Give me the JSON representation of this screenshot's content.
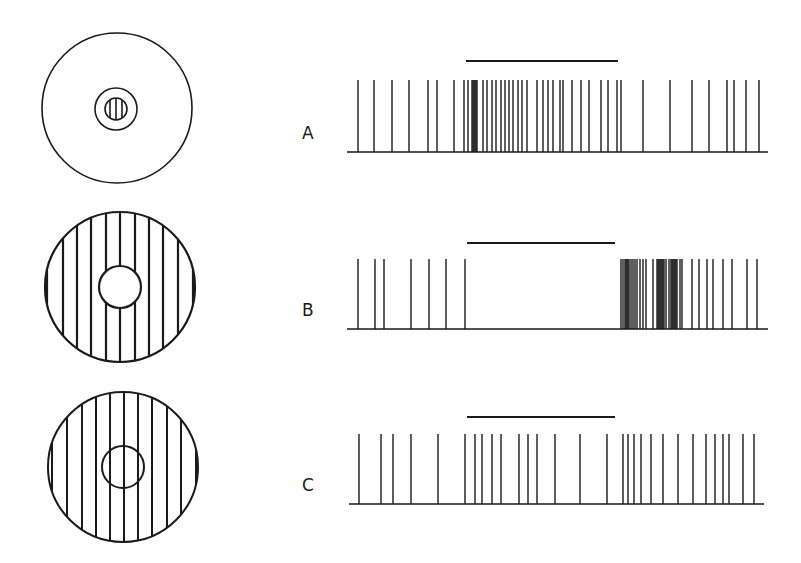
{
  "figure": {
    "ink_color": "#1a1a1a",
    "background": "#ffffff",
    "rows": [
      {
        "label": "A",
        "stimulus": "small-center-grating",
        "stimulus_bar": {
          "x1": 466,
          "x2": 618,
          "y": 61
        },
        "baseline": {
          "x1": 347,
          "x2": 768,
          "y": 152
        },
        "spike_top": 80,
        "spikes": [
          358,
          374,
          392,
          409,
          428,
          437,
          454,
          464,
          468,
          472,
          473,
          474,
          475,
          476,
          477,
          483,
          487,
          492,
          496,
          501,
          505,
          509,
          513,
          518,
          522,
          527,
          537,
          543,
          548,
          553,
          560,
          563,
          572,
          581,
          589,
          601,
          608,
          617,
          621,
          643,
          670,
          692,
          709,
          727,
          734,
          746,
          759
        ]
      },
      {
        "label": "B",
        "stimulus": "surround-grating-blank-center",
        "stimulus_bar": {
          "x1": 467,
          "x2": 615,
          "y": 243
        },
        "baseline": {
          "x1": 347,
          "x2": 768,
          "y": 329
        },
        "spike_top": 259,
        "spikes": [
          358,
          375,
          384,
          411,
          429,
          446,
          465,
          621,
          623,
          625,
          626,
          627,
          628,
          629,
          631,
          633,
          635,
          637,
          640,
          643,
          646,
          653,
          657,
          658,
          659,
          660,
          661,
          662,
          663,
          664,
          666,
          669,
          671,
          672,
          673,
          674,
          675,
          676,
          677,
          680,
          682,
          692,
          699,
          707,
          713,
          723,
          732,
          747,
          757
        ]
      },
      {
        "label": "C",
        "stimulus": "full-grating-with-center-outline",
        "stimulus_bar": {
          "x1": 467,
          "x2": 615,
          "y": 417
        },
        "baseline": {
          "x1": 349,
          "x2": 764,
          "y": 504
        },
        "spike_top": 434,
        "spikes": [
          359,
          381,
          393,
          411,
          438,
          465,
          475,
          482,
          492,
          501,
          519,
          528,
          537,
          555,
          580,
          607,
          623,
          628,
          634,
          641,
          651,
          663,
          678,
          693,
          706,
          715,
          723,
          729,
          743,
          754
        ]
      }
    ],
    "labels_text": {
      "a": "A",
      "b": "B",
      "c": "C"
    }
  }
}
